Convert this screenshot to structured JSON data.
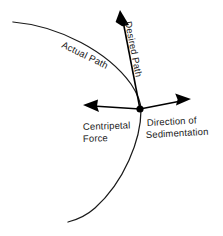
{
  "figure": {
    "background_color": "#ffffff",
    "line_color": "#1a1a1a",
    "width": 223,
    "height": 236
  },
  "labels": {
    "actual_path": "Actual Path",
    "desired_path": "Desired Path",
    "centripetal_force_line1": "Centripetal",
    "centripetal_force_line2": "Force",
    "sedimentation_line1": "Direction of",
    "sedimentation_line2": "Sedimentation"
  },
  "elements": {
    "center_point_label": "particle-position",
    "actual_path_curve_label": "actual-path-curve",
    "desired_path_arrow_label": "desired-path-arrow",
    "centripetal_arrow_label": "centripetal-force-arrow",
    "sedimentation_arrow_label": "sedimentation-arrow"
  },
  "geometry": {
    "center_x": 140,
    "center_y": 109,
    "desired_arrow_tip_x": 120,
    "desired_arrow_tip_y": 11,
    "centripetal_arrow_tip_x": 84,
    "centripetal_arrow_tip_y": 105,
    "sedimentation_arrow_tip_x": 191,
    "sedimentation_arrow_tip_y": 99
  }
}
